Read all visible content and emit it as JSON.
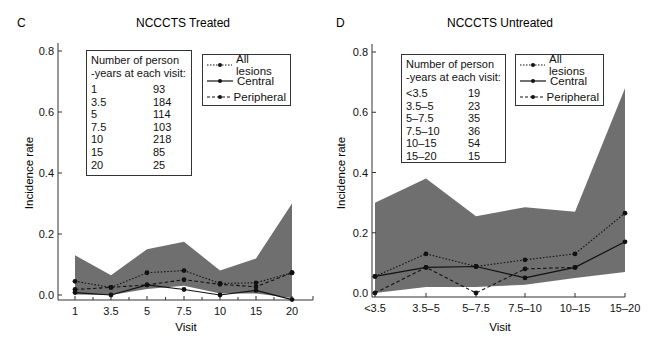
{
  "chart_data": [
    {
      "panel": "C",
      "title": "NCCCTS Treated",
      "type": "line",
      "xlabel": "Visit",
      "ylabel": "Incidence rate",
      "ylim": [
        0.0,
        0.8
      ],
      "yticks": [
        "0.0",
        "0.2",
        "0.4",
        "0.6",
        "0.8"
      ],
      "categories": [
        "1",
        "3.5",
        "5",
        "7.5",
        "10",
        "15",
        "20"
      ],
      "series": [
        {
          "name": "All lesions",
          "style": "dotted",
          "values": [
            0.045,
            0.025,
            0.073,
            0.08,
            0.038,
            0.04,
            0.073
          ]
        },
        {
          "name": "Central",
          "style": "solid",
          "values": [
            0.008,
            0.0,
            0.033,
            0.018,
            0.0,
            0.015,
            -0.015
          ]
        },
        {
          "name": "Peripheral",
          "style": "dashed",
          "values": [
            0.018,
            0.025,
            0.033,
            0.05,
            0.035,
            0.027,
            0.073
          ]
        }
      ],
      "confidence_band": {
        "upper": [
          0.13,
          0.065,
          0.15,
          0.175,
          0.08,
          0.12,
          0.3
        ],
        "lower": [
          0.002,
          0.0,
          0.02,
          0.03,
          0.005,
          0.005,
          -0.01
        ]
      },
      "legend": [
        "All lesions",
        "Central",
        "Peripheral"
      ],
      "person_years": {
        "header_line1": "Number of person",
        "header_line2": "-years at each visit:",
        "rows": [
          {
            "visit": "1",
            "value": "93"
          },
          {
            "visit": "3.5",
            "value": "184"
          },
          {
            "visit": "5",
            "value": "114"
          },
          {
            "visit": "7.5",
            "value": "103"
          },
          {
            "visit": "10",
            "value": "218"
          },
          {
            "visit": "15",
            "value": "85"
          },
          {
            "visit": "20",
            "value": "25"
          }
        ]
      },
      "grid": false
    },
    {
      "panel": "D",
      "title": "NCCCTS Untreated",
      "type": "line",
      "xlabel": "Visit",
      "ylabel": "Incidence rate",
      "ylim": [
        0.0,
        0.8
      ],
      "yticks": [
        "0.0",
        "0.2",
        "0.4",
        "0.6",
        "0.8"
      ],
      "categories": [
        "<3.5",
        "3.5–5",
        "5–7.5",
        "7.5–10",
        "10–15",
        "15–20"
      ],
      "series": [
        {
          "name": "All lesions",
          "style": "dotted",
          "values": [
            0.055,
            0.13,
            0.088,
            0.11,
            0.13,
            0.265
          ]
        },
        {
          "name": "Central",
          "style": "solid",
          "values": [
            0.055,
            0.085,
            0.088,
            0.05,
            0.085,
            0.17
          ]
        },
        {
          "name": "Peripheral",
          "style": "dashed",
          "values": [
            0.0,
            0.085,
            0.0,
            0.08,
            0.085,
            null
          ]
        }
      ],
      "confidence_band": {
        "upper": [
          0.3,
          0.38,
          0.255,
          0.285,
          0.27,
          0.68
        ],
        "lower": [
          0.0,
          0.02,
          0.02,
          0.027,
          0.05,
          0.07
        ]
      },
      "legend": [
        "All lesions",
        "Central",
        "Peripheral"
      ],
      "person_years": {
        "header_line1": "Number of person",
        "header_line2": "-years at each visit:",
        "rows": [
          {
            "visit": "<3.5",
            "value": "19"
          },
          {
            "visit": "3.5–5",
            "value": "23"
          },
          {
            "visit": "5–7.5",
            "value": "35"
          },
          {
            "visit": "7.5–10",
            "value": "36"
          },
          {
            "visit": "10–15",
            "value": "54"
          },
          {
            "visit": "15–20",
            "value": "15"
          }
        ]
      },
      "grid": false
    }
  ],
  "colors": {
    "band": "#6f6f6f",
    "line": "#111111",
    "axis": "#333333"
  }
}
